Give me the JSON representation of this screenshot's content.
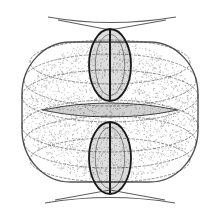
{
  "image": {
    "description": "Symmetric strange attractor density plot (grayscale)",
    "width": 220,
    "height": 218,
    "background": "#ffffff",
    "ink": "#1a1a1a"
  },
  "figure": {
    "center": [
      110,
      110
    ],
    "outer_barrel": {
      "rx": 88,
      "ry": 70,
      "cy": 112
    },
    "band_arcs": [
      {
        "cy": 62,
        "rx": 80,
        "ry": 22
      },
      {
        "cy": 80,
        "rx": 86,
        "ry": 26
      },
      {
        "cy": 96,
        "rx": 88,
        "ry": 26
      },
      {
        "cy": 126,
        "rx": 88,
        "ry": 26
      },
      {
        "cy": 142,
        "rx": 86,
        "ry": 26
      },
      {
        "cy": 160,
        "rx": 80,
        "ry": 22
      }
    ],
    "lenses": [
      {
        "name": "upper-lens",
        "cx": 110,
        "cy": 65,
        "rx": 21,
        "ry": 36
      },
      {
        "name": "lower-lens",
        "cx": 110,
        "cy": 158,
        "rx": 21,
        "ry": 36
      }
    ],
    "spindle": {
      "cx": 110,
      "cy": 110,
      "half_length": 68,
      "half_height": 7
    },
    "top_cusp": {
      "y": 17,
      "x_left": 48,
      "x_right": 176,
      "apex_y": 30
    },
    "bottom_cusp": {
      "y": 203,
      "x_left": 45,
      "x_right": 175,
      "apex_y": 190
    }
  }
}
